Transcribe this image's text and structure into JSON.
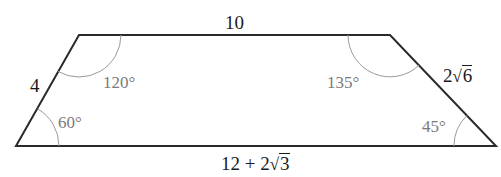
{
  "figure": {
    "type": "trapezoid",
    "vertices": {
      "top_left": [
        79,
        35
      ],
      "top_right": [
        390,
        35
      ],
      "bottom_right": [
        496,
        146
      ],
      "bottom_left": [
        16,
        146
      ]
    },
    "line_color": "#2a2a2a",
    "arc_color": "#9a9a9a"
  },
  "sides": {
    "top": "10",
    "left": "4",
    "right_coef": "2",
    "right_rad": "6",
    "bottom_prefix": "12 + 2",
    "bottom_rad": "3"
  },
  "angles": {
    "top_left": "120°",
    "top_right": "135°",
    "bottom_left": "60°",
    "bottom_right": "45°"
  }
}
